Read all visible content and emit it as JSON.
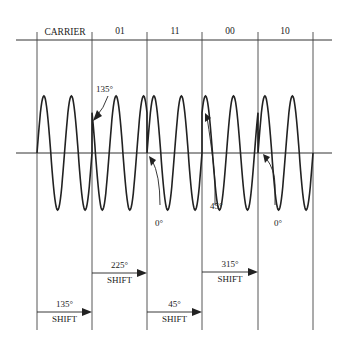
{
  "header": {
    "segments": [
      {
        "label": "CARRIER"
      },
      {
        "label": "01"
      },
      {
        "label": "11"
      },
      {
        "label": "00"
      },
      {
        "label": "10"
      }
    ]
  },
  "annotations": {
    "phase_135": "135°",
    "phase_0_a": "0°",
    "phase_45": "45°",
    "phase_0_b": "0°"
  },
  "shifts": [
    {
      "angle": "135°",
      "word": "SHIFT"
    },
    {
      "angle": "225°",
      "word": "SHIFT"
    },
    {
      "angle": "45°",
      "word": "SHIFT"
    },
    {
      "angle": "315°",
      "word": "SHIFT"
    }
  ],
  "colors": {
    "ink": "#222222",
    "background": "#ffffff"
  }
}
